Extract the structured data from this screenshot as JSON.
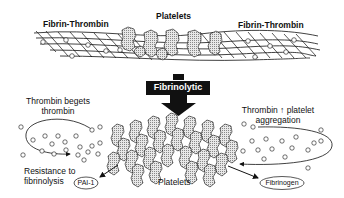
{
  "top": {
    "left_label": "Fibrin-Thrombin",
    "center_label": "Platelets",
    "right_label": "Fibrin-Thrombin"
  },
  "arrow": {
    "label": "Fibrinolytic"
  },
  "bottom": {
    "left_loop_line1": "Thrombin begets",
    "left_loop_line2": "thrombin",
    "right_loop_line1": "Thrombin ↑ platelet",
    "right_loop_line2": "aggregation",
    "resistance_line1": "Resistance to",
    "resistance_line2": "fibrinolysis",
    "pai_label": "PAI-1",
    "platelets_label": "Platelets",
    "fibrinogen_label": "Fibrinogen"
  }
}
